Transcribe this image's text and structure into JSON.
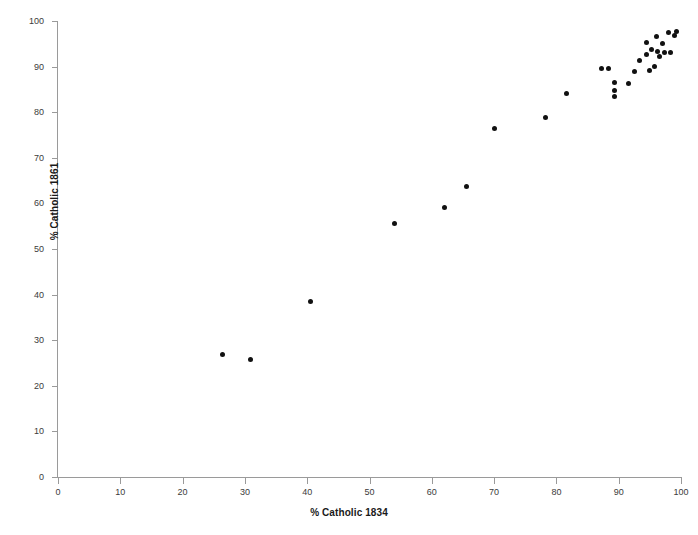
{
  "chart_data": {
    "type": "scatter",
    "title": "",
    "xlabel": "% Catholic 1834",
    "ylabel": "% Catholic 1861",
    "xlim": [
      0,
      100
    ],
    "ylim": [
      0,
      100
    ],
    "xticks": [
      0,
      10,
      20,
      30,
      40,
      50,
      60,
      70,
      80,
      90,
      100
    ],
    "yticks": [
      0,
      10,
      20,
      30,
      40,
      50,
      60,
      70,
      80,
      90,
      100
    ],
    "grid": false,
    "legend": null,
    "marker": {
      "shape": "circle",
      "color": "#111111",
      "size": 5
    },
    "points": [
      {
        "x": 26.4,
        "y": 26.8
      },
      {
        "x": 30.9,
        "y": 25.7
      },
      {
        "x": 40.5,
        "y": 38.4
      },
      {
        "x": 54.0,
        "y": 55.6
      },
      {
        "x": 62.0,
        "y": 59.1
      },
      {
        "x": 65.5,
        "y": 63.7
      },
      {
        "x": 70.0,
        "y": 76.5
      },
      {
        "x": 78.2,
        "y": 78.8
      },
      {
        "x": 81.6,
        "y": 84.2
      },
      {
        "x": 87.2,
        "y": 89.5
      },
      {
        "x": 88.3,
        "y": 89.5
      },
      {
        "x": 89.4,
        "y": 86.6
      },
      {
        "x": 89.4,
        "y": 84.7
      },
      {
        "x": 89.4,
        "y": 83.4
      },
      {
        "x": 91.5,
        "y": 86.2
      },
      {
        "x": 92.5,
        "y": 89.0
      },
      {
        "x": 93.3,
        "y": 91.4
      },
      {
        "x": 94.4,
        "y": 92.6
      },
      {
        "x": 94.5,
        "y": 95.2
      },
      {
        "x": 95.0,
        "y": 89.2
      },
      {
        "x": 95.3,
        "y": 93.7
      },
      {
        "x": 95.8,
        "y": 90.0
      },
      {
        "x": 96.1,
        "y": 96.5
      },
      {
        "x": 96.3,
        "y": 93.4
      },
      {
        "x": 96.5,
        "y": 92.3
      },
      {
        "x": 97.0,
        "y": 95.0
      },
      {
        "x": 97.4,
        "y": 93.2
      },
      {
        "x": 98.0,
        "y": 97.4
      },
      {
        "x": 98.3,
        "y": 93.0
      },
      {
        "x": 99.0,
        "y": 96.8
      },
      {
        "x": 99.3,
        "y": 97.6
      }
    ]
  },
  "colors": {
    "marker": "#111111",
    "axis": "#9a9a9a",
    "tick_label": "#3b3b3b",
    "axis_title": "#1a1a1a",
    "background": "#ffffff"
  }
}
